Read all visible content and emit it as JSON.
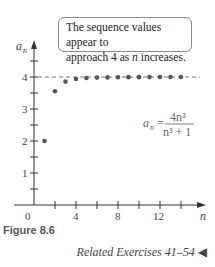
{
  "annotation": {
    "line1": "The sequence values appear to",
    "line2_pre": "approach 4 as ",
    "line2_var": "n",
    "line2_post": " increases."
  },
  "figure_label": "Figure 8.6",
  "related_exercises": "Related Exercises 41–54",
  "formula": {
    "lhs": "a",
    "lhs_sub": "n",
    "numerator": "4n³",
    "denominator": "n³ + 1"
  },
  "chart_data": {
    "type": "scatter",
    "title": "",
    "xlabel": "n",
    "ylabel": "a_n",
    "x": [
      1,
      2,
      3,
      4,
      5,
      6,
      7,
      8,
      9,
      10,
      11,
      12,
      13,
      14
    ],
    "values": [
      2.0,
      3.556,
      3.857,
      3.938,
      3.968,
      3.981,
      3.988,
      3.992,
      3.995,
      3.996,
      3.997,
      3.998,
      3.998,
      3.999
    ],
    "x_ticks": [
      "0",
      "4",
      "8",
      "12"
    ],
    "y_ticks": [
      "1",
      "2",
      "3",
      "4"
    ],
    "xlim": [
      0,
      15
    ],
    "ylim": [
      0,
      5
    ],
    "asymptote": 4,
    "grid": false,
    "annotation": "The sequence values appear to approach 4 as n increases."
  }
}
